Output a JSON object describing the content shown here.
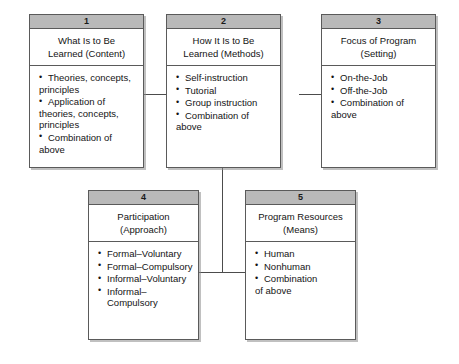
{
  "diagram": {
    "title_text": "Training Program Design Framework",
    "boxes": [
      {
        "number": "1",
        "title_lines": [
          "What Is to Be",
          "Learned (Content)"
        ],
        "items": [
          {
            "lines": [
              "Theories, concepts,",
              "principles"
            ]
          },
          {
            "lines": [
              "Application of",
              "theories, concepts,",
              "principles"
            ]
          },
          {
            "lines": [
              "Combination of",
              "above"
            ]
          }
        ]
      },
      {
        "number": "2",
        "title_lines": [
          "How It Is to Be",
          "Learned (Methods)"
        ],
        "items": [
          {
            "lines": [
              "Self-instruction"
            ]
          },
          {
            "lines": [
              "Tutorial"
            ]
          },
          {
            "lines": [
              "Group instruction"
            ]
          },
          {
            "lines": [
              "Combination of",
              "above"
            ]
          }
        ]
      },
      {
        "number": "3",
        "title_lines": [
          "Focus of Program",
          "(Setting)"
        ],
        "items": [
          {
            "lines": [
              "On-the-Job"
            ]
          },
          {
            "lines": [
              "Off-the-Job"
            ]
          },
          {
            "lines": [
              "Combination of",
              "above"
            ]
          }
        ]
      },
      {
        "number": "4",
        "title_lines": [
          "Participation",
          "(Approach)"
        ],
        "items": [
          {
            "lines": [
              "Formal–Voluntary"
            ]
          },
          {
            "lines": [
              "Formal–Compulsory"
            ]
          },
          {
            "lines": [
              "Informal–Voluntary"
            ]
          },
          {
            "lines": [
              "Informal–Compulsory"
            ]
          }
        ]
      },
      {
        "number": "5",
        "title_lines": [
          "Program Resources",
          "(Means)"
        ],
        "items": [
          {
            "lines": [
              "Human"
            ]
          },
          {
            "lines": [
              "Nonhuman"
            ]
          },
          {
            "lines": [
              "Combination",
              "of above"
            ]
          }
        ]
      }
    ],
    "colors": {
      "header_fill": "#b9b9b9",
      "border": "#5a5a5a",
      "connector": "#4c4c4c",
      "background": "#ffffff",
      "text": "#141414"
    }
  }
}
